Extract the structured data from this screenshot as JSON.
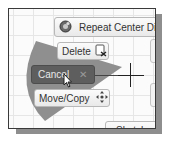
{
  "marking_menu": {
    "repeat_label": "Repeat Center Dia",
    "delete_label": "Delete",
    "cancel_label": "Cancel",
    "move_copy_label": "Move/Copy",
    "sketch_label": "Sketch",
    "cancel_close_glyph": "✕",
    "sketch_dropdown_glyph": "▼"
  },
  "colors": {
    "wedge": "#8f8f8f",
    "cancel_bg": "#5e5e5e",
    "frame_border": "#3a3a3a",
    "shadow": "#8e8e8e"
  }
}
